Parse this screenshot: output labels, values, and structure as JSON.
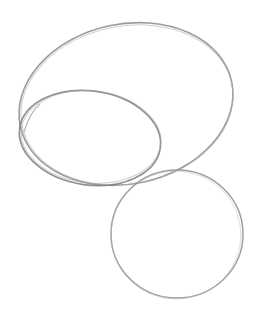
{
  "canvas": {
    "width": 260,
    "height": 315,
    "background": "#ffffff"
  },
  "stroke": {
    "color": "#8a8a8a",
    "dark": "#6f6f6f",
    "light": "#b5b5b5"
  },
  "shapes": [
    {
      "name": "large-ellipse",
      "cx": 126,
      "cy": 104,
      "rx": 108,
      "ry": 80,
      "rotate": -12
    },
    {
      "name": "inner-ellipse",
      "cx": 90,
      "cy": 138,
      "rx": 71,
      "ry": 47,
      "rotate": 8
    },
    {
      "name": "lower-circle",
      "cx": 177,
      "cy": 234,
      "rx": 66,
      "ry": 64,
      "rotate": 0
    }
  ]
}
